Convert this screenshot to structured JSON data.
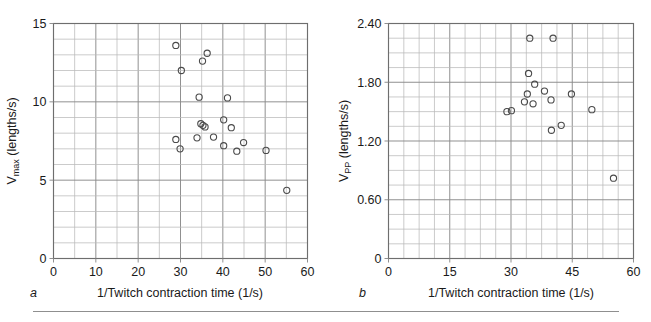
{
  "figure": {
    "background": "#ffffff",
    "marker_color": "#4a4a4a",
    "grid_major_color": "#8a8a8a",
    "grid_minor_color": "#b9b9b9",
    "frame_color": "#6e6e6e",
    "divider_visible": true
  },
  "panels": [
    {
      "letter": "a",
      "xlabel": "1/Twitch contraction time (1/s)",
      "ylabel_main": "V",
      "ylabel_sub": "max",
      "ylabel_tail": " (lengths/s)",
      "ylabel_full": "Vmax (lengths/s)",
      "x_ticks": [
        "0",
        "10",
        "20",
        "30",
        "40",
        "50",
        "60"
      ],
      "y_ticks": [
        "0",
        "5",
        "10",
        "15"
      ]
    },
    {
      "letter": "b",
      "xlabel": "1/Twitch contraction time (1/s)",
      "ylabel_main": "V",
      "ylabel_sub": "PP",
      "ylabel_tail": " (lengths/s)",
      "ylabel_full": "VPP (lengths/s)",
      "x_ticks": [
        "0",
        "15",
        "30",
        "45",
        "60"
      ],
      "y_ticks": [
        "0",
        "0.60",
        "1.20",
        "1.80",
        "2.40"
      ]
    }
  ],
  "chart_data": [
    {
      "type": "scatter",
      "panel": "a",
      "title": "",
      "xlabel": "1/Twitch contraction time (1/s)",
      "ylabel": "Vmax (lengths/s)",
      "xlim": [
        0,
        60
      ],
      "ylim": [
        0,
        15
      ],
      "xticks": [
        0,
        10,
        20,
        30,
        40,
        50,
        60
      ],
      "yticks": [
        0,
        5,
        10,
        15
      ],
      "x_minor_step": 5,
      "y_minor_step": 1,
      "grid": true,
      "legend": "none",
      "marker": "open-circle",
      "points": [
        {
          "x": 28.9,
          "y": 13.6
        },
        {
          "x": 30.2,
          "y": 12.0
        },
        {
          "x": 35.2,
          "y": 12.6
        },
        {
          "x": 36.3,
          "y": 13.1
        },
        {
          "x": 34.4,
          "y": 10.3
        },
        {
          "x": 41.1,
          "y": 10.25
        },
        {
          "x": 34.8,
          "y": 8.6
        },
        {
          "x": 35.3,
          "y": 8.5
        },
        {
          "x": 35.8,
          "y": 8.4
        },
        {
          "x": 40.2,
          "y": 8.85
        },
        {
          "x": 42.0,
          "y": 8.35
        },
        {
          "x": 28.9,
          "y": 7.6
        },
        {
          "x": 29.9,
          "y": 7.0
        },
        {
          "x": 33.9,
          "y": 7.7
        },
        {
          "x": 37.8,
          "y": 7.75
        },
        {
          "x": 40.2,
          "y": 7.2
        },
        {
          "x": 43.3,
          "y": 6.85
        },
        {
          "x": 44.9,
          "y": 7.4
        },
        {
          "x": 50.2,
          "y": 6.9
        },
        {
          "x": 55.1,
          "y": 4.35
        }
      ]
    },
    {
      "type": "scatter",
      "panel": "b",
      "title": "",
      "xlabel": "1/Twitch contraction time (1/s)",
      "ylabel": "VPP (lengths/s)",
      "xlim": [
        0,
        60
      ],
      "ylim": [
        0,
        2.4
      ],
      "xticks": [
        0,
        15,
        30,
        45,
        60
      ],
      "yticks": [
        0,
        0.6,
        1.2,
        1.8,
        2.4
      ],
      "x_minor_step": 3.75,
      "y_minor_step": 0.15,
      "grid": true,
      "legend": "none",
      "marker": "open-circle",
      "points": [
        {
          "x": 34.6,
          "y": 2.25
        },
        {
          "x": 40.3,
          "y": 2.25
        },
        {
          "x": 34.3,
          "y": 1.89
        },
        {
          "x": 35.8,
          "y": 1.78
        },
        {
          "x": 38.2,
          "y": 1.71
        },
        {
          "x": 34.0,
          "y": 1.68
        },
        {
          "x": 39.8,
          "y": 1.62
        },
        {
          "x": 44.8,
          "y": 1.68
        },
        {
          "x": 33.3,
          "y": 1.6
        },
        {
          "x": 35.4,
          "y": 1.58
        },
        {
          "x": 29.0,
          "y": 1.5
        },
        {
          "x": 30.1,
          "y": 1.51
        },
        {
          "x": 49.8,
          "y": 1.52
        },
        {
          "x": 42.3,
          "y": 1.36
        },
        {
          "x": 39.9,
          "y": 1.31
        },
        {
          "x": 55.1,
          "y": 0.82
        }
      ]
    }
  ]
}
